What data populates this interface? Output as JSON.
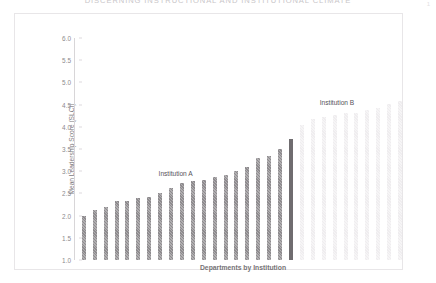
{
  "document": {
    "title_clipped": "DISCERNING INSTRUCTIONAL AND INSTITUTIONAL CLIMATE",
    "corner_mark": "1",
    "watermark": ""
  },
  "chart_data": {
    "type": "bar",
    "title": "",
    "xlabel": "Departments by Institution",
    "ylabel": "Mean Leadership Score (SLCI)",
    "ylim": [
      1.0,
      6.0
    ],
    "ytick_labels": [
      "1.0",
      "1.5",
      "2.0",
      "2.5",
      "3.0",
      "3.5",
      "4.0",
      "4.5",
      "5.0",
      "5.5",
      "6.0"
    ],
    "ytick_values": [
      1.0,
      1.5,
      2.0,
      2.5,
      3.0,
      3.5,
      4.0,
      4.5,
      5.0,
      5.5,
      6.0
    ],
    "grid": false,
    "legend": "none",
    "annotations": [
      {
        "text": "Institution A",
        "x_index": 8.6,
        "y": 3.02
      },
      {
        "text": "Institution B",
        "x_index": 23.4,
        "y": 4.62
      }
    ],
    "series": [
      {
        "name": "Institution A",
        "color": "#8e8b8e",
        "categories": [
          "A1",
          "A2",
          "A3",
          "A4",
          "A5",
          "A6",
          "A7",
          "A8",
          "A9",
          "A10",
          "A11",
          "A12",
          "A13",
          "A14",
          "A15",
          "A16",
          "A17",
          "A18",
          "A19"
        ],
        "values": [
          2.0,
          2.12,
          2.2,
          2.32,
          2.34,
          2.4,
          2.42,
          2.52,
          2.62,
          2.74,
          2.78,
          2.8,
          2.86,
          2.92,
          3.0,
          3.1,
          3.3,
          3.34,
          3.5
        ]
      },
      {
        "name": "Institution A (highlighted)",
        "color": "#6f6c6f",
        "categories": [
          "A20"
        ],
        "values": [
          3.72
        ]
      },
      {
        "name": "Institution B",
        "color": "#efedef",
        "categories": [
          "B1",
          "B2",
          "B3",
          "B4",
          "B5",
          "B6",
          "B7",
          "B8",
          "B9",
          "B10"
        ],
        "values": [
          4.04,
          4.18,
          4.22,
          4.26,
          4.3,
          4.3,
          4.38,
          4.42,
          4.52,
          4.58
        ]
      }
    ]
  }
}
